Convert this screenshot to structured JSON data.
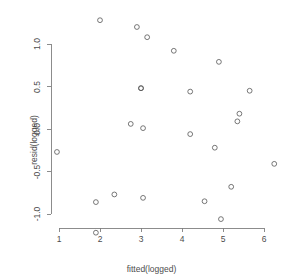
{
  "chart_data": {
    "type": "scatter",
    "title": "",
    "xlabel": "fitted(logged)",
    "ylabel": "resid(logged)",
    "xlim": [
      0.6,
      6.6
    ],
    "ylim": [
      -1.32,
      1.38
    ],
    "xticks": [
      1,
      2,
      3,
      4,
      5,
      6
    ],
    "xtick_labels": [
      "1",
      "2",
      "3",
      "4",
      "5",
      "6"
    ],
    "yticks": [
      -1.0,
      -0.5,
      0.0,
      0.5,
      1.0
    ],
    "ytick_labels": [
      "-1.0",
      "-0.5",
      "0.0",
      "0.5",
      "1.0"
    ],
    "grid": false,
    "legend": null,
    "marker": "open-circle",
    "marker_color": "#555555",
    "marker_radius": 2.4,
    "axis_color": "#808080",
    "background": "#ffffff",
    "n_points": 24,
    "x": [
      0.95,
      1.9,
      1.9,
      2.35,
      2.75,
      2.9,
      3.0,
      3.05,
      3.05,
      3.15,
      3.8,
      4.2,
      4.2,
      4.55,
      4.8,
      4.9,
      4.95,
      5.2,
      5.35,
      5.4,
      5.65,
      6.25,
      2.0,
      5.6
    ],
    "y": [
      -0.27,
      -0.86,
      -1.22,
      -0.77,
      0.06,
      1.2,
      0.48,
      0.01,
      -0.81,
      1.08,
      0.92,
      0.44,
      -0.06,
      -0.85,
      -0.22,
      0.79,
      -1.06,
      -0.68,
      0.09,
      0.18,
      0.45,
      -0.41,
      1.28,
      0.45
    ],
    "points": [
      {
        "x": 0.95,
        "y": -0.27
      },
      {
        "x": 1.9,
        "y": -0.86
      },
      {
        "x": 1.9,
        "y": -1.22
      },
      {
        "x": 2.0,
        "y": 1.28
      },
      {
        "x": 2.35,
        "y": -0.77
      },
      {
        "x": 2.75,
        "y": 0.06
      },
      {
        "x": 2.9,
        "y": 1.2
      },
      {
        "x": 3.0,
        "y": 0.48
      },
      {
        "x": 3.05,
        "y": 0.01
      },
      {
        "x": 3.05,
        "y": -0.81
      },
      {
        "x": 3.15,
        "y": 1.08
      },
      {
        "x": 3.8,
        "y": 0.92
      },
      {
        "x": 4.2,
        "y": 0.44
      },
      {
        "x": 4.2,
        "y": -0.06
      },
      {
        "x": 4.55,
        "y": -0.85
      },
      {
        "x": 4.8,
        "y": -0.22
      },
      {
        "x": 4.9,
        "y": 0.79
      },
      {
        "x": 4.95,
        "y": -1.06
      },
      {
        "x": 5.2,
        "y": -0.68
      },
      {
        "x": 5.35,
        "y": 0.09
      },
      {
        "x": 5.4,
        "y": 0.18
      },
      {
        "x": 5.65,
        "y": 0.45
      },
      {
        "x": 6.25,
        "y": -0.41
      },
      {
        "x": 3.0,
        "y": 0.48
      }
    ]
  },
  "axes": {
    "x_title": "fitted(logged)",
    "y_title": "resid(logged)"
  }
}
